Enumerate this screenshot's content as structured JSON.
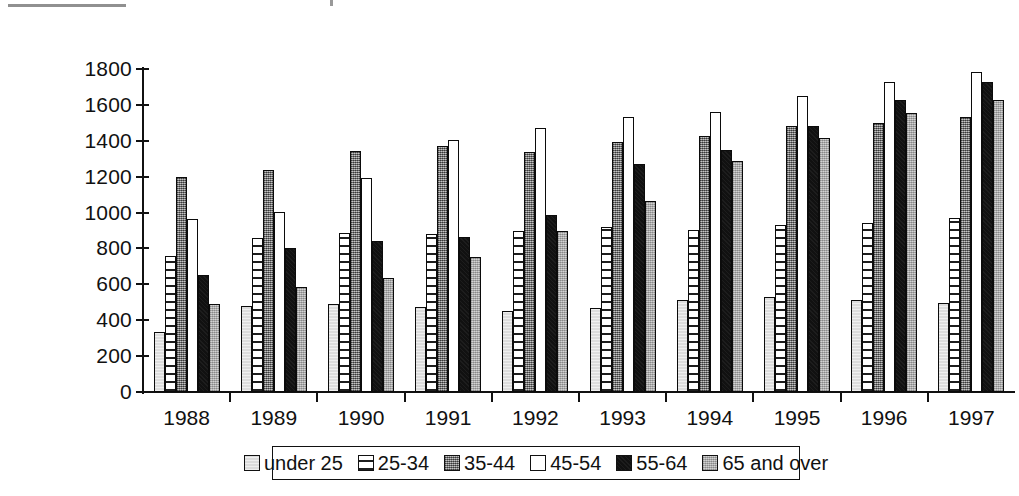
{
  "chart_data": {
    "type": "bar",
    "title": "",
    "subtitle": "",
    "xlabel": "",
    "ylabel": "",
    "ylim": [
      0,
      1800
    ],
    "ytick_step": 200,
    "yticks": [
      1800,
      1600,
      1400,
      1200,
      1000,
      800,
      600,
      400,
      200,
      0
    ],
    "grid": false,
    "legend_position": "bottom",
    "categories": [
      "1988",
      "1989",
      "1990",
      "1991",
      "1992",
      "1993",
      "1994",
      "1995",
      "1996",
      "1997"
    ],
    "series": [
      {
        "name": "under 25",
        "swatch": "light-gray",
        "color": "#dcdcdc",
        "values": [
          335,
          480,
          490,
          475,
          450,
          470,
          510,
          530,
          510,
          495
        ]
      },
      {
        "name": "25-34",
        "swatch": "white-striped",
        "color": "#ffffff",
        "values": [
          760,
          860,
          885,
          880,
          895,
          920,
          905,
          930,
          940,
          970
        ]
      },
      {
        "name": "35-44",
        "swatch": "dark-gray",
        "color": "#8e8e8e",
        "values": [
          1200,
          1240,
          1345,
          1370,
          1335,
          1395,
          1425,
          1480,
          1500,
          1530
        ]
      },
      {
        "name": "45-54",
        "swatch": "white",
        "color": "#ffffff",
        "values": [
          965,
          1005,
          1195,
          1405,
          1470,
          1535,
          1560,
          1650,
          1725,
          1785
        ]
      },
      {
        "name": "55-64",
        "swatch": "black",
        "color": "#111111",
        "values": [
          650,
          800,
          840,
          865,
          985,
          1270,
          1350,
          1485,
          1630,
          1730
        ]
      },
      {
        "name": "65 and over",
        "swatch": "medium-gray",
        "color": "#b9b9b9",
        "values": [
          490,
          585,
          635,
          755,
          895,
          1065,
          1285,
          1415,
          1555,
          1630
        ]
      }
    ],
    "legend_entries": [
      "under 25",
      "25-34",
      "35-44",
      "45-54",
      "55-64",
      "65 and over"
    ]
  }
}
